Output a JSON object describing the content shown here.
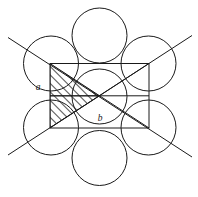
{
  "figure": {
    "background_color": "#ffffff",
    "stroke_color": "#1a1a1a",
    "hatch_color": "#1a1a1a",
    "width": 198,
    "height": 197,
    "labels": {
      "a": "a",
      "b": "b"
    },
    "label_positions": {
      "a": {
        "x": 38,
        "y": 90
      },
      "b": {
        "x": 100,
        "y": 121
      }
    },
    "circles": [
      {
        "name": "circle-top",
        "cx": 99.5,
        "cy": 35.5,
        "r": 27.5
      },
      {
        "name": "circle-top-left",
        "cx": 51.0,
        "cy": 63.5,
        "r": 27.5
      },
      {
        "name": "circle-top-right",
        "cx": 148.5,
        "cy": 63.5,
        "r": 27.5
      },
      {
        "name": "circle-center",
        "cx": 99.5,
        "cy": 96.5,
        "r": 27.5
      },
      {
        "name": "circle-bottom-left",
        "cx": 51.0,
        "cy": 127.5,
        "r": 27.5
      },
      {
        "name": "circle-bottom-right",
        "cx": 148.5,
        "cy": 127.5,
        "r": 27.5
      },
      {
        "name": "circle-bottom",
        "cx": 99.5,
        "cy": 158.0,
        "r": 27.5
      }
    ],
    "rectangle": {
      "name": "unit-cell-rectangle",
      "x": 50.0,
      "y": 63.5,
      "width": 99.0,
      "height": 64.5
    },
    "inner_lines": [
      {
        "name": "rectangle-midline-horizontal",
        "x1": 50.0,
        "y1": 95.8,
        "x2": 149.0,
        "y2": 95.8
      },
      {
        "name": "rectangle-diagonal-main",
        "x1": 50.0,
        "y1": 63.5,
        "x2": 149.0,
        "y2": 128.0
      },
      {
        "name": "rectangle-diagonal-anti",
        "x1": 50.0,
        "y1": 128.0,
        "x2": 149.0,
        "y2": 63.5
      },
      {
        "name": "cell-vertical-midline",
        "x1": 99.5,
        "y1": 63.5,
        "x2": 99.5,
        "y2": 128.0
      }
    ],
    "tangent_lines": [
      {
        "name": "tangent-line-descending",
        "x1": 8.0,
        "y1": 37.5,
        "x2": 192.0,
        "y2": 157.0
      },
      {
        "name": "tangent-line-ascending",
        "x1": 8.0,
        "y1": 155.0,
        "x2": 192.0,
        "y2": 35.5
      }
    ],
    "hatched_regions": [
      {
        "name": "hatched-triangle-upper",
        "points": "50,63.5 99.5,95.8 50,95.8"
      },
      {
        "name": "hatched-triangle-lower",
        "points": "50,95.8 99.5,95.8 50,128"
      }
    ],
    "caption": {
      "text": "",
      "truncated": true
    }
  }
}
